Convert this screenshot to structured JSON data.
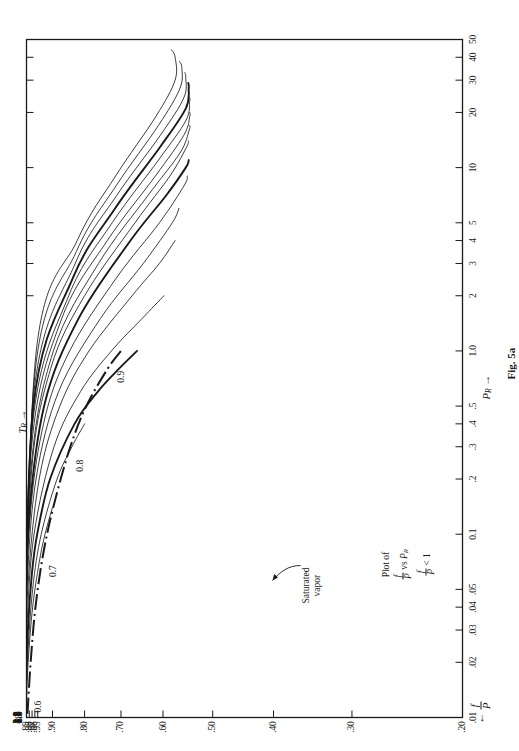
{
  "figure": {
    "caption": "Fig. 5a",
    "note_lines": [
      "Plot of",
      "f/P vs P_R",
      "f/P < 1"
    ],
    "note_plain": "Plot of f/P vs P_R ; f/P < 1",
    "note_prefix": "Plot of",
    "note_vs": "vs",
    "note_lt": "< 1",
    "x_axis_title": "P",
    "x_axis_sub": "R",
    "y_axis_title": "f/P",
    "curve_family_title": "T",
    "curve_family_sub": "R",
    "saturated_label_line1": "Saturated",
    "saturated_label_line2": "vapor",
    "arrow_left": "←",
    "arrow_right": "→"
  },
  "chart_data": {
    "type": "line",
    "xlabel": "P_R",
    "ylabel": "f/P",
    "xscale": "log",
    "yscale": "log",
    "xlim": [
      0.01,
      50
    ],
    "ylim": [
      0.2,
      0.99
    ],
    "grid": false,
    "legend": "curve end labels (T_R)",
    "x_ticks": [
      {
        "value": 0.01,
        "label": ".01"
      },
      {
        "value": 0.02,
        "label": ".02"
      },
      {
        "value": 0.03,
        "label": ".03"
      },
      {
        "value": 0.04,
        "label": ".04"
      },
      {
        "value": 0.05,
        "label": ".05"
      },
      {
        "value": 0.1,
        "label": "0.1"
      },
      {
        "value": 0.2,
        "label": ".2"
      },
      {
        "value": 0.3,
        "label": ".3"
      },
      {
        "value": 0.4,
        "label": ".4"
      },
      {
        "value": 0.5,
        "label": ".5"
      },
      {
        "value": 1.0,
        "label": "1.0"
      },
      {
        "value": 2,
        "label": "2"
      },
      {
        "value": 3,
        "label": "3"
      },
      {
        "value": 4,
        "label": "4"
      },
      {
        "value": 5,
        "label": "5"
      },
      {
        "value": 10,
        "label": "10"
      },
      {
        "value": 20,
        "label": "20"
      },
      {
        "value": 30,
        "label": "30"
      },
      {
        "value": 40,
        "label": "40"
      },
      {
        "value": 50,
        "label": "50"
      }
    ],
    "y_ticks": [
      {
        "value": 0.99,
        "label": ".99"
      },
      {
        "value": 0.98,
        "label": ".98"
      },
      {
        "value": 0.97,
        "label": ".97"
      },
      {
        "value": 0.96,
        "label": ".96"
      },
      {
        "value": 0.95,
        "label": ".95"
      },
      {
        "value": 0.9,
        "label": ".90"
      },
      {
        "value": 0.8,
        "label": ".80"
      },
      {
        "value": 0.7,
        "label": ".70"
      },
      {
        "value": 0.6,
        "label": ".60"
      },
      {
        "value": 0.5,
        "label": ".50"
      },
      {
        "value": 0.4,
        "label": ".40"
      },
      {
        "value": 0.3,
        "label": ".30"
      },
      {
        "value": 0.2,
        "label": ".20"
      }
    ],
    "series": [
      {
        "name": "0.8",
        "label": "0.8",
        "heavy": false,
        "points": [
          [
            0.01,
            0.992
          ],
          [
            0.02,
            0.984
          ],
          [
            0.04,
            0.968
          ],
          [
            0.07,
            0.945
          ],
          [
            0.1,
            0.925
          ],
          [
            0.14,
            0.9
          ]
        ]
      },
      {
        "name": "0.9",
        "label": ".9",
        "heavy": false,
        "points": [
          [
            0.01,
            0.9935
          ],
          [
            0.02,
            0.987
          ],
          [
            0.05,
            0.968
          ],
          [
            0.1,
            0.938
          ],
          [
            0.2,
            0.885
          ],
          [
            0.3,
            0.838
          ],
          [
            0.4,
            0.8
          ]
        ]
      },
      {
        "name": "1.0",
        "label": "1.0",
        "heavy": true,
        "points": [
          [
            0.01,
            0.995
          ],
          [
            0.03,
            0.985
          ],
          [
            0.06,
            0.971
          ],
          [
            0.1,
            0.952
          ],
          [
            0.2,
            0.908
          ],
          [
            0.4,
            0.83
          ],
          [
            0.6,
            0.762
          ],
          [
            0.8,
            0.705
          ],
          [
            1.0,
            0.66
          ]
        ]
      },
      {
        "name": "1.1",
        "label": "1.1",
        "heavy": false,
        "points": [
          [
            0.01,
            0.9963
          ],
          [
            0.03,
            0.989
          ],
          [
            0.1,
            0.963
          ],
          [
            0.3,
            0.895
          ],
          [
            0.6,
            0.812
          ],
          [
            1.0,
            0.725
          ],
          [
            1.5,
            0.648
          ],
          [
            2.0,
            0.598
          ]
        ]
      },
      {
        "name": "1.2",
        "label": "1.2",
        "heavy": false,
        "points": [
          [
            0.01,
            0.9971
          ],
          [
            0.05,
            0.9855
          ],
          [
            0.2,
            0.945
          ],
          [
            0.5,
            0.876
          ],
          [
            1.0,
            0.787
          ],
          [
            2.0,
            0.672
          ],
          [
            3.0,
            0.608
          ],
          [
            4.0,
            0.574
          ]
        ]
      },
      {
        "name": "1.3",
        "label": "1.3",
        "heavy": false,
        "points": [
          [
            0.01,
            0.9977
          ],
          [
            0.05,
            0.9885
          ],
          [
            0.2,
            0.956
          ],
          [
            0.6,
            0.88
          ],
          [
            1.5,
            0.755
          ],
          [
            3.0,
            0.645
          ],
          [
            5.0,
            0.58
          ],
          [
            6.0,
            0.566
          ]
        ]
      },
      {
        "name": "1.4",
        "label": "1.4",
        "heavy": false,
        "points": [
          [
            0.01,
            0.9981
          ],
          [
            0.1,
            0.9815
          ],
          [
            0.4,
            0.93
          ],
          [
            1.0,
            0.845
          ],
          [
            2.5,
            0.712
          ],
          [
            5.0,
            0.608
          ],
          [
            8.0,
            0.555
          ],
          [
            9.0,
            0.549
          ]
        ]
      },
      {
        "name": "1.5",
        "label": "1.5",
        "heavy": true,
        "points": [
          [
            0.01,
            0.9984
          ],
          [
            0.1,
            0.9845
          ],
          [
            0.5,
            0.928
          ],
          [
            1.5,
            0.818
          ],
          [
            4.0,
            0.676
          ],
          [
            7.0,
            0.594
          ],
          [
            10.0,
            0.552
          ],
          [
            11.0,
            0.546
          ]
        ]
      },
      {
        "name": "1.6",
        "label": "1.6",
        "heavy": false,
        "points": [
          [
            0.01,
            0.9986
          ],
          [
            0.2,
            0.974
          ],
          [
            0.8,
            0.906
          ],
          [
            2.0,
            0.8
          ],
          [
            5.0,
            0.665
          ],
          [
            9.0,
            0.585
          ],
          [
            13.0,
            0.55
          ],
          [
            14.0,
            0.547
          ]
        ]
      },
      {
        "name": "1.7",
        "label": "1.7",
        "heavy": false,
        "points": [
          [
            0.01,
            0.9988
          ],
          [
            0.2,
            0.977
          ],
          [
            1.0,
            0.897
          ],
          [
            3.0,
            0.76
          ],
          [
            7.0,
            0.635
          ],
          [
            12.0,
            0.564
          ],
          [
            16.0,
            0.545
          ],
          [
            17.0,
            0.544
          ]
        ]
      },
      {
        "name": "1.8",
        "label": "1.8",
        "heavy": false,
        "points": [
          [
            0.01,
            0.999
          ],
          [
            0.3,
            0.972
          ],
          [
            1.5,
            0.87
          ],
          [
            4.0,
            0.736
          ],
          [
            9.0,
            0.617
          ],
          [
            15.0,
            0.556
          ],
          [
            19.0,
            0.544
          ],
          [
            20.0,
            0.544
          ]
        ]
      },
      {
        "name": "1.9",
        "label": "1.9",
        "heavy": false,
        "points": [
          [
            0.01,
            0.9991
          ],
          [
            0.4,
            0.968
          ],
          [
            2.0,
            0.848
          ],
          [
            5.0,
            0.723
          ],
          [
            11.0,
            0.61
          ],
          [
            18.0,
            0.552
          ],
          [
            23.0,
            0.544
          ],
          [
            24.0,
            0.544
          ]
        ]
      },
      {
        "name": "2.0",
        "label": "2.0",
        "heavy": true,
        "points": [
          [
            0.01,
            0.9992
          ],
          [
            0.5,
            0.965
          ],
          [
            2.5,
            0.835
          ],
          [
            6.0,
            0.715
          ],
          [
            13.0,
            0.606
          ],
          [
            21.0,
            0.552
          ],
          [
            27.0,
            0.546
          ],
          [
            29.0,
            0.547
          ]
        ]
      },
      {
        "name": "2.1",
        "label": "2.1",
        "heavy": false,
        "points": [
          [
            0.01,
            0.9993
          ],
          [
            0.6,
            0.963
          ],
          [
            3.0,
            0.828
          ],
          [
            7.0,
            0.712
          ],
          [
            15.0,
            0.606
          ],
          [
            24.0,
            0.556
          ],
          [
            31.0,
            0.552
          ],
          [
            33.0,
            0.554
          ]
        ]
      },
      {
        "name": "2.2",
        "label": "2.2",
        "heavy": false,
        "points": [
          [
            0.01,
            0.9994
          ],
          [
            0.8,
            0.958
          ],
          [
            3.5,
            0.824
          ],
          [
            8.0,
            0.712
          ],
          [
            17.0,
            0.61
          ],
          [
            27.0,
            0.564
          ],
          [
            35.0,
            0.56
          ],
          [
            38.0,
            0.565
          ]
        ]
      },
      {
        "name": "2.3",
        "label": "2.3",
        "heavy": false,
        "points": [
          [
            0.01,
            0.9994
          ],
          [
            1.0,
            0.955
          ],
          [
            4.0,
            0.822
          ],
          [
            9.0,
            0.714
          ],
          [
            19.0,
            0.616
          ],
          [
            30.0,
            0.574
          ],
          [
            40.0,
            0.574
          ],
          [
            44.0,
            0.582
          ]
        ]
      }
    ],
    "saturated_vapor": {
      "label": "Saturated vapor",
      "style": "dash-dot",
      "point_labels": [
        {
          "label": "0.6",
          "Tr": 0.6
        },
        {
          "label": "0.7",
          "Tr": 0.7
        },
        {
          "label": "0.8",
          "Tr": 0.8
        },
        {
          "label": "0.9",
          "Tr": 0.9
        }
      ],
      "points": [
        [
          0.0105,
          0.9865
        ],
        [
          0.02,
          0.975
        ],
        [
          0.04,
          0.958
        ],
        [
          0.08,
          0.93
        ],
        [
          0.15,
          0.893
        ],
        [
          0.3,
          0.843
        ],
        [
          0.5,
          0.795
        ],
        [
          0.8,
          0.735
        ],
        [
          1.0,
          0.7
        ]
      ]
    }
  },
  "y_tick_labels": [
    ".99",
    ".98",
    ".97",
    ".96",
    ".95",
    ".90",
    ".80",
    ".70",
    ".60",
    ".50",
    ".40",
    ".30",
    ".20"
  ],
  "x_tick_labels": [
    ".01",
    ".02",
    ".03",
    ".04",
    ".05",
    "0.1",
    ".2",
    ".3",
    ".4",
    ".5",
    "1.0",
    "2",
    "3",
    "4",
    "5",
    "10",
    "20",
    "30",
    "40",
    "50"
  ],
  "tr_end_labels_left": [
    ".8",
    ".9",
    "1.0",
    "1.1",
    "1.2",
    "1.3",
    "1.4",
    "1.5",
    "1.6",
    "1.7",
    "1.8",
    "1.9",
    "2.0",
    "2.1",
    "2.2",
    "2.3"
  ],
  "tr_end_labels_top": [
    "2",
    "1.5",
    "1.0"
  ],
  "sat_labels": [
    "0.6",
    "0.7",
    "0.8",
    "0.9"
  ]
}
